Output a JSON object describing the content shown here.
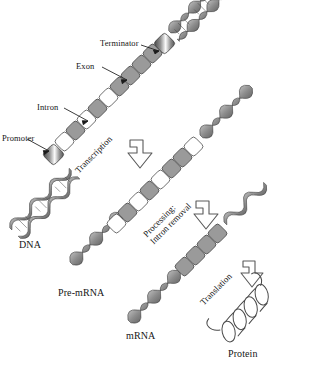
{
  "figure": {
    "type": "biology-process-diagram"
  },
  "colors": {
    "exon_fill": "#9a9a9a",
    "intron_fill": "#ffffff",
    "outline": "#3a3a3a",
    "ribbon_fill": "#8e8e8e",
    "background": "#ffffff",
    "text": "#151515"
  },
  "callouts": [
    {
      "id": "terminator",
      "label": "Terminator"
    },
    {
      "id": "exon",
      "label": "Exon"
    },
    {
      "id": "intron",
      "label": "Intron"
    },
    {
      "id": "promoter",
      "label": "Promoter"
    }
  ],
  "molecules": [
    {
      "id": "dna",
      "label": "DNA"
    },
    {
      "id": "pre-mrna",
      "label": "Pre-mRNA"
    },
    {
      "id": "mrna",
      "label": "mRNA"
    },
    {
      "id": "protein",
      "label": "Protein"
    }
  ],
  "processes": [
    {
      "id": "transcription",
      "line1": "Transcription",
      "line2": ""
    },
    {
      "id": "processing",
      "line1": "Processing:",
      "line2": "Intron removal"
    },
    {
      "id": "translation",
      "line1": "Translation",
      "line2": ""
    }
  ],
  "strands": {
    "dna": {
      "segments": [
        "helix",
        "promoter",
        "intron",
        "exon",
        "intron",
        "exon",
        "intron",
        "exon",
        "exon",
        "terminator",
        "helix"
      ],
      "exon_count": 4,
      "intron_count": 3
    },
    "pre_mrna": {
      "segments": [
        "ribbon",
        "intron",
        "exon",
        "intron",
        "exon",
        "intron",
        "exon",
        "exon"
      ],
      "exon_count": 4,
      "intron_count": 3
    },
    "mrna": {
      "segments": [
        "ribbon",
        "exon",
        "exon",
        "exon",
        "exon"
      ],
      "exon_count": 4,
      "intron_count": 0
    },
    "protein": {
      "shape": "alpha-helix-coil",
      "turns": 4
    }
  }
}
